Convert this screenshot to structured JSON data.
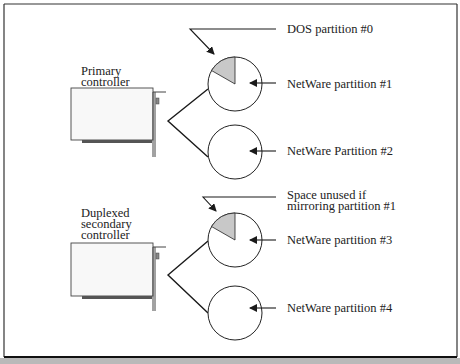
{
  "diagram": {
    "type": "disk-duplexing",
    "controllers": [
      {
        "id": "primary",
        "label_lines": [
          "Primary",
          "controller"
        ],
        "disks": [
          {
            "id": "disk1",
            "partitions": [
              {
                "label": "DOS partition #0",
                "shaded": true
              },
              {
                "label": "NetWare partition #1",
                "shaded": false
              }
            ]
          },
          {
            "id": "disk2",
            "partitions": [
              {
                "label": "NetWare Partition #2",
                "shaded": false
              }
            ]
          }
        ]
      },
      {
        "id": "secondary",
        "label_lines": [
          "Duplexed",
          "secondary",
          "controller"
        ],
        "disks": [
          {
            "id": "disk3",
            "partitions": [
              {
                "label_lines": [
                  "Space unused if",
                  "mirroring partition #1"
                ],
                "shaded": true
              },
              {
                "label": "NetWare partition #3",
                "shaded": false
              }
            ]
          },
          {
            "id": "disk4",
            "partitions": [
              {
                "label": "NetWare partition #4",
                "shaded": false
              }
            ]
          }
        ]
      }
    ],
    "colors": {
      "stroke": "#1a1a1a",
      "shade": "#c8c8c8",
      "background": "#ffffff",
      "bottom_band": "#b9b9b9"
    }
  }
}
